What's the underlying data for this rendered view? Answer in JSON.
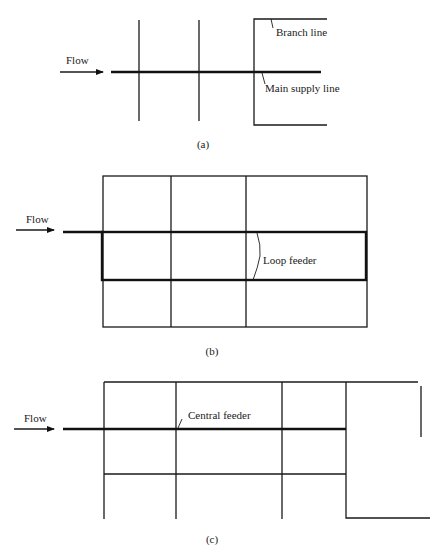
{
  "figure": {
    "panels": [
      {
        "id": "a",
        "caption": "(a)",
        "title": "Branching system",
        "flow_label": "Flow",
        "labels": {
          "branch": "Branch line",
          "main": "Main supply line"
        }
      },
      {
        "id": "b",
        "caption": "(b)",
        "title": "Loop (grid) system with loop feeder",
        "flow_label": "Flow",
        "labels": {
          "loop": "Loop feeder"
        }
      },
      {
        "id": "c",
        "caption": "(c)",
        "title": "Grid system with central feeder",
        "flow_label": "Flow",
        "labels": {
          "central": "Central feeder"
        }
      }
    ]
  },
  "colors": {
    "line": "#1a1a1a",
    "background": "#ffffff"
  }
}
